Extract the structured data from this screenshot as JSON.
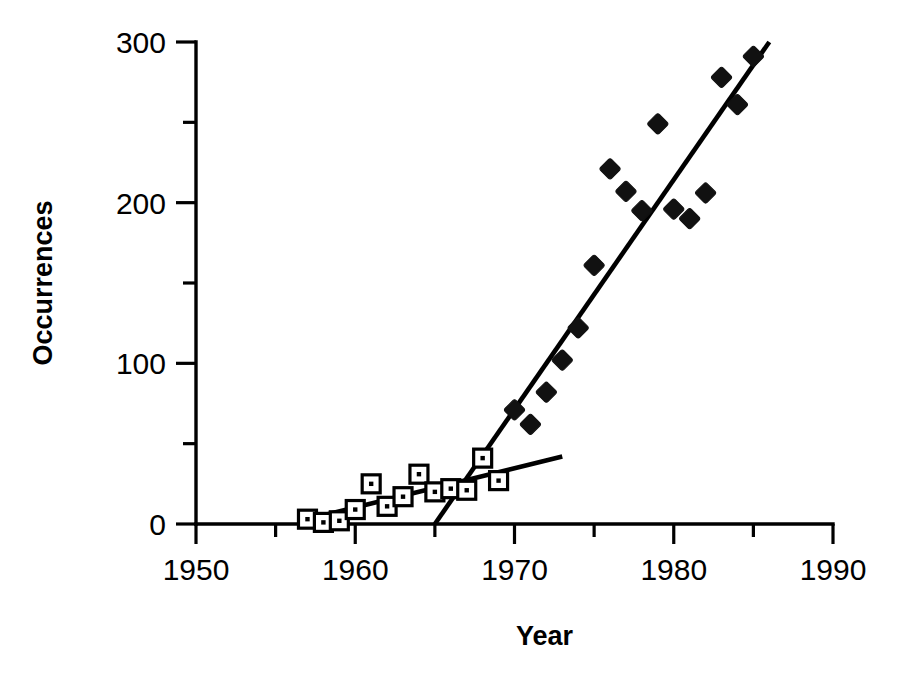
{
  "chart_data": {
    "type": "scatter",
    "title": "",
    "xlabel": "Year",
    "ylabel": "Occurrences",
    "xlim": [
      1950,
      1990
    ],
    "ylim": [
      0,
      300
    ],
    "xticks": [
      1950,
      1960,
      1970,
      1980,
      1990
    ],
    "xtick_labels": [
      "1950",
      "1960",
      "1970",
      "1980",
      "1990"
    ],
    "xticks_minor": [
      1955,
      1965,
      1975,
      1985
    ],
    "yticks": [
      0,
      100,
      200,
      300
    ],
    "ytick_labels": [
      "0",
      "100",
      "200",
      "300"
    ],
    "yticks_minor": [
      50,
      150,
      250
    ],
    "grid": false,
    "legend": "none",
    "series": [
      {
        "name": "early period",
        "marker": "open-square",
        "points": [
          {
            "x": 1957,
            "y": 3
          },
          {
            "x": 1958,
            "y": 1
          },
          {
            "x": 1959,
            "y": 2
          },
          {
            "x": 1960,
            "y": 9
          },
          {
            "x": 1961,
            "y": 25
          },
          {
            "x": 1962,
            "y": 11
          },
          {
            "x": 1963,
            "y": 17
          },
          {
            "x": 1964,
            "y": 31
          },
          {
            "x": 1965,
            "y": 20
          },
          {
            "x": 1966,
            "y": 22
          },
          {
            "x": 1967,
            "y": 21
          },
          {
            "x": 1968,
            "y": 41
          },
          {
            "x": 1969,
            "y": 27
          }
        ]
      },
      {
        "name": "late period",
        "marker": "filled-diamond",
        "points": [
          {
            "x": 1970,
            "y": 71
          },
          {
            "x": 1971,
            "y": 62
          },
          {
            "x": 1972,
            "y": 82
          },
          {
            "x": 1973,
            "y": 102
          },
          {
            "x": 1974,
            "y": 122
          },
          {
            "x": 1975,
            "y": 161
          },
          {
            "x": 1976,
            "y": 221
          },
          {
            "x": 1977,
            "y": 207
          },
          {
            "x": 1978,
            "y": 195
          },
          {
            "x": 1979,
            "y": 249
          },
          {
            "x": 1980,
            "y": 196
          },
          {
            "x": 1981,
            "y": 190
          },
          {
            "x": 1982,
            "y": 206
          },
          {
            "x": 1983,
            "y": 278
          },
          {
            "x": 1984,
            "y": 261
          },
          {
            "x": 1985,
            "y": 291
          }
        ]
      }
    ],
    "trend_lines": [
      {
        "name": "early-trend",
        "x_start": 1957,
        "y_start": 3,
        "x_end": 1973,
        "y_end": 42
      },
      {
        "name": "late-trend",
        "x_start": 1965,
        "y_start": 0,
        "x_end": 1986,
        "y_end": 300
      }
    ]
  }
}
